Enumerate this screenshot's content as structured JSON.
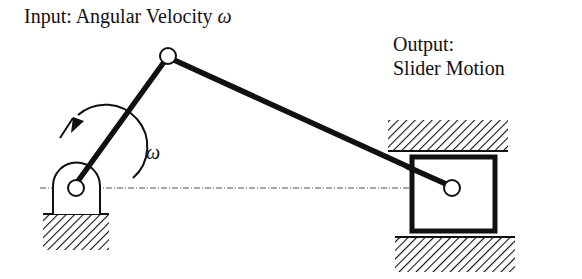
{
  "diagram": {
    "input_label": {
      "text": "Input: Angular Velocity",
      "symbol": "ω"
    },
    "output_label": {
      "line1": "Output:",
      "line2": "Slider Motion"
    },
    "crank_rotation_label": "ω",
    "components": [
      "ground-pivot-support",
      "crank-link",
      "coupler-link",
      "slider-block",
      "upper-guide-ground",
      "lower-guide-ground",
      "centerline"
    ],
    "colors": {
      "stroke": "#111111",
      "background": "#ffffff",
      "centerline": "#555555"
    }
  }
}
